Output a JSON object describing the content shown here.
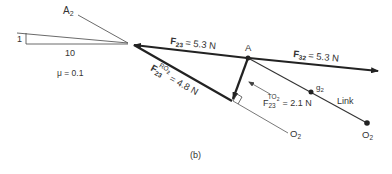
{
  "diagram": {
    "caption": "(b)",
    "slope": {
      "point_label": "A",
      "point_sub": "2",
      "rise": "1",
      "run": "10",
      "friction": "μ = 0.1"
    },
    "forces": {
      "f23": {
        "symbol": "F",
        "sub": "23",
        "value": "= 5.3 N"
      },
      "f32": {
        "symbol": "F",
        "sub": "32",
        "value": "= 5.3 N"
      },
      "f23_ro2": {
        "symbol": "F",
        "sub": "23",
        "sup": "RO",
        "sup_sub": "2",
        "value": "= 4.8 N"
      },
      "f23_to2": {
        "symbol": "F",
        "sub": "23",
        "sup": "TO",
        "sup_sub": "2",
        "value": "= 2.1 N"
      }
    },
    "points": {
      "a": "A",
      "g2": "g",
      "g2_sub": "2",
      "o2_ref": "O",
      "o2_ref_sub": "2",
      "o2": "O",
      "o2_sub": "2"
    },
    "link_label": "Link",
    "colors": {
      "line": "#2a2a2a",
      "thin": "#555555"
    }
  }
}
